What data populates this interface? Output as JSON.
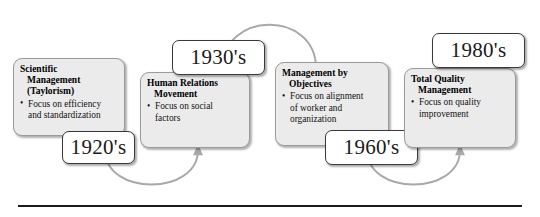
{
  "diagram": {
    "accent_color": "#a8a8a8",
    "box_fill": "#ebebeb",
    "box_border": "#9a9a9a",
    "year_box_border": "#3a3a3a",
    "rule_color": "#1c1c1c",
    "bullet_glyph": "•"
  },
  "stages": [
    {
      "id": "scientific-management",
      "title_lines": [
        "Scientific",
        "Management",
        "(Taylorism)"
      ],
      "bullet_lines": [
        "Focus on efficiency",
        "and standardization"
      ],
      "year": "1920's"
    },
    {
      "id": "human-relations-movement",
      "title_lines": [
        "Human Relations",
        "Movement"
      ],
      "bullet_lines": [
        "Focus on social",
        "factors"
      ],
      "year": "1930's"
    },
    {
      "id": "management-by-objectives",
      "title_lines": [
        "Management by",
        "Objectives"
      ],
      "bullet_lines": [
        "Focus on alignment",
        "of worker and",
        "organization"
      ],
      "year": "1960's"
    },
    {
      "id": "total-quality-management",
      "title_lines": [
        "Total Quality",
        "Management"
      ],
      "bullet_lines": [
        "Focus on quality",
        "improvement"
      ],
      "year": "1980's"
    }
  ],
  "connectors": [
    {
      "id": "connector-1-2",
      "shape": "arc-below",
      "direction": "left-to-right"
    },
    {
      "id": "connector-2-3",
      "shape": "arc-above",
      "direction": "left-to-right"
    },
    {
      "id": "connector-3-4",
      "shape": "arc-below",
      "direction": "left-to-right"
    }
  ]
}
